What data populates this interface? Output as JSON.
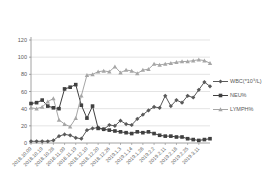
{
  "chart_data": {
    "type": "line",
    "title": "",
    "x_labels": [
      "2018.10.09",
      "2018.10.19",
      "2018.10.28",
      "2018.11.09",
      "2018.11.19",
      "2018.12.10",
      "2018.12.20",
      "2018.12.26",
      "2019.1.3",
      "2019.1.14",
      "2019.1.28",
      "2019.2.2",
      "2019.2.11",
      "2019.2.18",
      "2019.2.25",
      "2019.3.11"
    ],
    "label_every": 2,
    "xlabel": "",
    "ylabel": "",
    "ylim": [
      0,
      120
    ],
    "ytick_step": 20,
    "yticks": [
      0,
      20,
      40,
      60,
      80,
      100,
      120
    ],
    "grid": true,
    "legend_position": "right",
    "series": [
      {
        "name": "WBC(*10⁹/L)",
        "marker": "diamond",
        "color": "#595959",
        "values": [
          2,
          2,
          2,
          2,
          3,
          8,
          10,
          9,
          6,
          5,
          15,
          17,
          18,
          16,
          21,
          20,
          26,
          22,
          21,
          28,
          33,
          38,
          42,
          41,
          55,
          43,
          50,
          47,
          55,
          53,
          62,
          71,
          66
        ]
      },
      {
        "name": "NEU%",
        "marker": "square",
        "color": "#404040",
        "values": [
          46,
          47,
          50,
          43,
          41,
          40,
          63,
          65,
          68,
          44,
          29,
          43,
          17,
          16,
          15,
          14,
          13,
          12,
          11,
          13,
          12,
          13,
          11,
          9,
          8,
          8,
          7,
          7,
          5,
          4,
          3,
          4,
          5
        ]
      },
      {
        "name": "LYMPH%",
        "marker": "triangle",
        "color": "#a6a6a6",
        "values": [
          41,
          40,
          42,
          48,
          52,
          27,
          22,
          19,
          29,
          55,
          79,
          80,
          83,
          84,
          83,
          89,
          82,
          85,
          84,
          81,
          85,
          86,
          92,
          91,
          92,
          93,
          94,
          95,
          95,
          96,
          97,
          96,
          93
        ]
      }
    ],
    "axis_color": "#8c8c8c",
    "grid_color": "#d9d9d9",
    "text_color": "#595959"
  }
}
